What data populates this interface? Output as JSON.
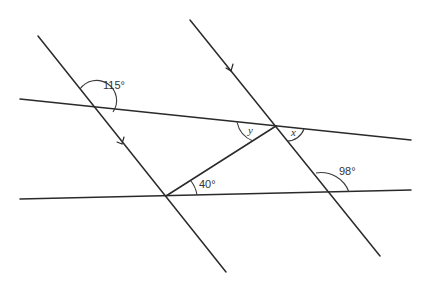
{
  "diagram": {
    "type": "parallel-lines-angles",
    "colors": {
      "line": "#2a2a2a",
      "text": "#333333",
      "background": "#ffffff"
    },
    "lines": [
      {
        "id": "upper-transversal",
        "from": [
          20,
          99
        ],
        "to": [
          411,
          140
        ]
      },
      {
        "id": "lower-transversal",
        "from": [
          20,
          199
        ],
        "to": [
          411,
          190
        ]
      },
      {
        "id": "left-parallel",
        "from": [
          38,
          36
        ],
        "to": [
          226,
          272
        ],
        "arrow": true
      },
      {
        "id": "right-parallel",
        "from": [
          190,
          20
        ],
        "to": [
          380,
          256
        ],
        "arrow": true
      },
      {
        "id": "connector",
        "from": [
          166,
          196
        ],
        "to": [
          276,
          126
        ]
      }
    ],
    "angles": [
      {
        "label": "115°",
        "kind": "value"
      },
      {
        "label": "y",
        "kind": "variable"
      },
      {
        "label": "x",
        "kind": "variable"
      },
      {
        "label": "40°",
        "kind": "value"
      },
      {
        "label": "98°",
        "kind": "value"
      }
    ]
  }
}
